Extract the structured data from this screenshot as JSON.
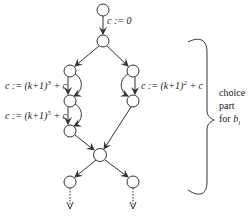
{
  "diagram": {
    "type": "flow-graph",
    "edge_labels": {
      "init": "c := 0",
      "left_upper": "c := (k+1)",
      "left_upper_exp": "3",
      "left_upper_tail": " + c",
      "left_lower": "c := (k+1)",
      "left_lower_exp": "5",
      "left_lower_tail": " + c",
      "right": "c := (k+1)",
      "right_exp": "2",
      "right_tail": " + c"
    },
    "brace_label": {
      "line1": "choice",
      "line2": "part",
      "line3_prefix": "for ",
      "line3_var": "b",
      "line3_sub": "i"
    },
    "nodes": [
      {
        "id": "start",
        "x": 103,
        "y": 10
      },
      {
        "id": "split",
        "x": 103,
        "y": 41
      },
      {
        "id": "left-1",
        "x": 70,
        "y": 71
      },
      {
        "id": "left-2",
        "x": 70,
        "y": 101
      },
      {
        "id": "left-3",
        "x": 70,
        "y": 131
      },
      {
        "id": "right-1",
        "x": 133,
        "y": 71
      },
      {
        "id": "right-2",
        "x": 133,
        "y": 101
      },
      {
        "id": "merge",
        "x": 100,
        "y": 155
      },
      {
        "id": "out-left",
        "x": 70,
        "y": 182
      },
      {
        "id": "out-right",
        "x": 133,
        "y": 182
      }
    ],
    "colors": {
      "stroke": "#333333",
      "text": "#222222"
    }
  }
}
